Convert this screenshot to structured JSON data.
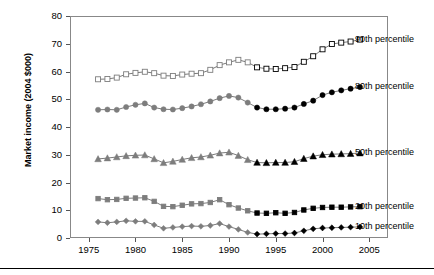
{
  "chart_data": {
    "type": "line",
    "title": "",
    "xlabel": "",
    "ylabel": "Market income (2004 $000)",
    "xlim": [
      1973,
      2007
    ],
    "ylim": [
      0,
      80
    ],
    "xticks": [
      1975,
      1980,
      1985,
      1990,
      1995,
      2000,
      2005
    ],
    "yticks": [
      0,
      10,
      20,
      30,
      40,
      50,
      60,
      70,
      80
    ],
    "grid": false,
    "legend_position": "right",
    "x": [
      1976,
      1977,
      1978,
      1979,
      1980,
      1981,
      1982,
      1983,
      1984,
      1985,
      1986,
      1987,
      1988,
      1989,
      1990,
      1991,
      1992,
      1993,
      1994,
      1995,
      1996,
      1997,
      1998,
      1999,
      2000,
      2001,
      2002,
      2003,
      2004
    ],
    "series": [
      {
        "name": "90th percentile",
        "marker": "open-square",
        "values": [
          57.2,
          57.3,
          57.8,
          59.0,
          59.5,
          59.9,
          59.4,
          58.5,
          58.4,
          58.9,
          59.2,
          59.4,
          60.6,
          62.3,
          63.3,
          64.2,
          63.3,
          61.5,
          61.0,
          60.9,
          61.2,
          61.6,
          63.5,
          65.5,
          68.0,
          69.9,
          70.4,
          70.8,
          71.5
        ],
        "split_index": 17,
        "color_early": "#7d7d7d",
        "color_late": "#000000"
      },
      {
        "name": "80th percentile",
        "marker": "filled-circle",
        "values": [
          46.2,
          46.3,
          46.2,
          47.2,
          48.0,
          48.5,
          47.0,
          46.4,
          46.3,
          46.8,
          47.4,
          48.2,
          49.2,
          50.4,
          51.2,
          50.6,
          48.8,
          47.0,
          46.4,
          46.4,
          46.6,
          47.0,
          48.3,
          49.5,
          51.5,
          52.5,
          53.2,
          53.8,
          54.4
        ],
        "split_index": 17,
        "color_early": "#7d7d7d",
        "color_late": "#000000"
      },
      {
        "name": "50th percentile",
        "marker": "filled-triangle",
        "values": [
          28.5,
          28.8,
          29.2,
          29.6,
          29.8,
          29.9,
          28.5,
          27.1,
          27.6,
          28.3,
          28.9,
          29.2,
          29.8,
          30.6,
          30.9,
          29.7,
          28.2,
          27.2,
          27.1,
          27.2,
          27.2,
          27.5,
          28.6,
          29.5,
          30.0,
          30.2,
          30.3,
          30.4,
          30.6
        ],
        "split_index": 17,
        "color_early": "#7d7d7d",
        "color_late": "#000000"
      },
      {
        "name": "20th percentile",
        "marker": "filled-square",
        "values": [
          14.2,
          13.8,
          13.9,
          14.3,
          14.4,
          14.5,
          13.2,
          11.4,
          11.3,
          11.8,
          12.3,
          12.4,
          12.8,
          13.8,
          12.0,
          10.8,
          9.8,
          9.0,
          8.9,
          9.1,
          8.9,
          9.2,
          10.1,
          10.7,
          11.0,
          11.1,
          11.1,
          11.2,
          11.3
        ],
        "split_index": 17,
        "color_early": "#7d7d7d",
        "color_late": "#000000"
      },
      {
        "name": "10th percentile",
        "marker": "filled-diamond",
        "values": [
          5.8,
          5.5,
          5.8,
          6.2,
          6.0,
          6.0,
          4.7,
          3.5,
          3.8,
          4.1,
          4.3,
          4.2,
          4.5,
          5.2,
          4.1,
          3.1,
          2.0,
          1.4,
          1.5,
          1.6,
          1.6,
          1.8,
          2.6,
          3.3,
          3.6,
          3.7,
          3.8,
          3.9,
          4.0
        ],
        "split_index": 17,
        "color_early": "#7d7d7d",
        "color_late": "#000000"
      }
    ]
  },
  "axis": {
    "y_title": "Market income (2004 $000)",
    "y_tick_labels": [
      "0",
      "10",
      "20",
      "30",
      "40",
      "50",
      "60",
      "70",
      "80"
    ],
    "x_tick_labels": [
      "1975",
      "1980",
      "1985",
      "1990",
      "1995",
      "2000",
      "2005"
    ]
  },
  "legend": {
    "items": [
      {
        "label": "90th percentile"
      },
      {
        "label": "80th percentile"
      },
      {
        "label": "50th percentile"
      },
      {
        "label": "20th percentile"
      },
      {
        "label": "10th percentile"
      }
    ]
  }
}
